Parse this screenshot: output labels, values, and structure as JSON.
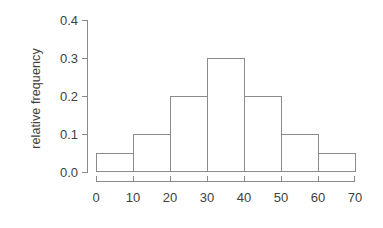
{
  "chart_data": {
    "type": "bar",
    "title": "",
    "subtitle": "",
    "xlabel": "",
    "ylabel": "relative frequency",
    "bin_width": 10,
    "bin_edges": [
      0,
      10,
      20,
      30,
      40,
      50,
      60,
      70
    ],
    "categories": [
      "0-10",
      "10-20",
      "20-30",
      "30-40",
      "40-50",
      "50-60",
      "60-70"
    ],
    "values": [
      0.05,
      0.1,
      0.2,
      0.3,
      0.2,
      0.1,
      0.05
    ],
    "xlim": [
      0,
      70
    ],
    "ylim": [
      0.0,
      0.4
    ],
    "x_ticks": [
      0,
      10,
      20,
      30,
      40,
      50,
      60,
      70
    ],
    "x_tick_labels": [
      "0",
      "10",
      "20",
      "30",
      "40",
      "50",
      "60",
      "70"
    ],
    "y_ticks": [
      0.0,
      0.1,
      0.2,
      0.3,
      0.4
    ],
    "y_tick_labels": [
      "0.0",
      "0.1",
      "0.2",
      "0.3",
      "0.4"
    ],
    "grid": false,
    "legend": null,
    "legend_position": "none",
    "bar_fill": "#ffffff",
    "bar_stroke": "#8b8b8b",
    "axis_color": "#8a8a8a",
    "text_color": "#3f3f3f",
    "background": "#ffffff",
    "annotations": []
  }
}
